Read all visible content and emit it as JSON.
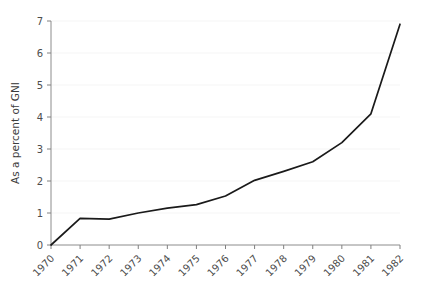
{
  "chart_data": {
    "type": "line",
    "title": "",
    "xlabel": "",
    "ylabel": "As a percent of GNI",
    "x": [
      1970,
      1971,
      1972,
      1973,
      1974,
      1975,
      1976,
      1977,
      1978,
      1979,
      1980,
      1981,
      1982
    ],
    "categories": [
      "1970",
      "1971",
      "1972",
      "1973",
      "1974",
      "1975",
      "1976",
      "1977",
      "1978",
      "1979",
      "1980",
      "1981",
      "1982"
    ],
    "values": [
      0.0,
      0.83,
      0.81,
      1.0,
      1.15,
      1.26,
      1.53,
      2.02,
      2.3,
      2.6,
      3.2,
      4.1,
      6.9
    ],
    "series": [
      {
        "name": "",
        "values": [
          0.0,
          0.83,
          0.81,
          1.0,
          1.15,
          1.26,
          1.53,
          2.02,
          2.3,
          2.6,
          3.2,
          4.1,
          6.9
        ]
      }
    ],
    "ylim": [
      0,
      7
    ],
    "xlim": [
      1970,
      1982
    ],
    "yticks": [
      0,
      1,
      2,
      3,
      4,
      5,
      6,
      7
    ],
    "ytick_labels": [
      "0",
      "1",
      "2",
      "3",
      "4",
      "5",
      "6",
      "7"
    ],
    "xtick_labels": [
      "1970",
      "1971",
      "1972",
      "1973",
      "1974",
      "1975",
      "1976",
      "1977",
      "1978",
      "1979",
      "1980",
      "1981",
      "1982"
    ],
    "grid": true,
    "grid_axis": "y",
    "legend": false,
    "legend_position": "none",
    "line_color": "#1a1a1a",
    "grid_color": "#f5f5f5",
    "axis_color": "#808080",
    "background_color": "#ffffff",
    "xtick_rotation": -45
  }
}
